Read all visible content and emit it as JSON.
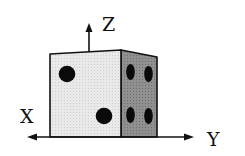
{
  "diagram": {
    "axes": {
      "x_label": "X",
      "y_label": "Y",
      "z_label": "Z"
    },
    "faces": {
      "front": {
        "pips": 2,
        "color": "#e6e6e6"
      },
      "side": {
        "pips": 4,
        "color": "#8a8a8a"
      }
    },
    "colors": {
      "stroke": "#111111",
      "pip": "#0a0a0a",
      "background": "#ffffff"
    }
  }
}
